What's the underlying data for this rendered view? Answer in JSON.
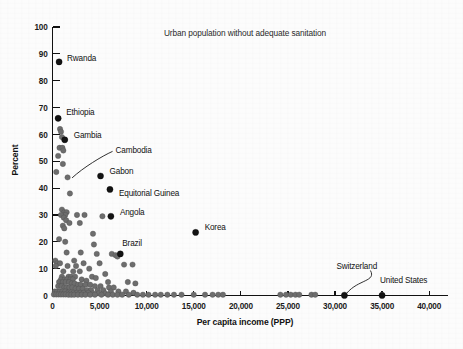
{
  "chart_data": {
    "type": "scatter",
    "title": "Urban population without adequate sanitation",
    "xlabel": "Per capita income (PPP)",
    "ylabel": "Percent",
    "xlim": [
      0,
      42000
    ],
    "ylim": [
      0,
      100
    ],
    "grid": false,
    "legend": "none",
    "xticks": [
      0,
      5000,
      10000,
      15000,
      20000,
      25000,
      30000,
      35000,
      40000
    ],
    "xtick_labels": [
      "0",
      "5,000",
      "10,000",
      "15,000",
      "20,000",
      "25,000",
      "30,000",
      "35,000",
      "40,000"
    ],
    "yticks": [
      0,
      10,
      20,
      30,
      40,
      50,
      60,
      70,
      80,
      90,
      100
    ],
    "ytick_labels": [
      "0",
      "10",
      "20",
      "30",
      "40",
      "50",
      "60",
      "70",
      "80",
      "90",
      "100"
    ],
    "point_color": "#6d6d6d",
    "highlight_color": "#131313",
    "annotations": [
      {
        "label": "Rwanda",
        "x": 700,
        "y": 87,
        "dx": 8,
        "dy": -4,
        "leader": false
      },
      {
        "label": "Ethiopia",
        "x": 600,
        "y": 66,
        "dx": 8,
        "dy": -6,
        "leader": false
      },
      {
        "label": "Gambia",
        "x": 1300,
        "y": 58,
        "dx": 9,
        "dy": -5,
        "leader": false
      },
      {
        "label": "Cambodia",
        "x": 1600,
        "y": 44,
        "dx": 48,
        "dy": -27,
        "leader": true
      },
      {
        "label": "Gabon",
        "x": 5100,
        "y": 44.5,
        "dx": 9,
        "dy": -5,
        "leader": false
      },
      {
        "label": "Equitorial Guinea",
        "x": 6100,
        "y": 39.5,
        "dx": 9,
        "dy": 4,
        "leader": false
      },
      {
        "label": "Angola",
        "x": 6200,
        "y": 29.5,
        "dx": 9,
        "dy": -4,
        "leader": false
      },
      {
        "label": "Brazil",
        "x": 7200,
        "y": 15.5,
        "dx": 2,
        "dy": -11,
        "leader": false
      },
      {
        "label": "Korea",
        "x": 15200,
        "y": 23.5,
        "dx": 9,
        "dy": -5,
        "leader": false
      },
      {
        "label": "Switzerland",
        "x": 31000,
        "y": 0,
        "dx": -8,
        "dy": -30,
        "leader": true
      },
      {
        "label": "United States",
        "x": 35000,
        "y": 0,
        "dx": -2,
        "dy": -16,
        "leader": false
      }
    ],
    "highlight_points": [
      {
        "name": "Rwanda",
        "x": 700,
        "y": 87
      },
      {
        "name": "Ethiopia",
        "x": 600,
        "y": 66
      },
      {
        "name": "Gambia",
        "x": 1300,
        "y": 58
      },
      {
        "name": "Gabon",
        "x": 5100,
        "y": 44.5
      },
      {
        "name": "Equitorial Guinea",
        "x": 6100,
        "y": 39.5
      },
      {
        "name": "Angola",
        "x": 6200,
        "y": 29.5
      },
      {
        "name": "Brazil",
        "x": 7200,
        "y": 15.5
      },
      {
        "name": "Korea",
        "x": 15200,
        "y": 23.5
      },
      {
        "name": "Switzerland",
        "x": 31000,
        "y": 0
      },
      {
        "name": "United States",
        "x": 35000,
        "y": 0
      }
    ],
    "points": [
      [
        600,
        66
      ],
      [
        800,
        62
      ],
      [
        900,
        61
      ],
      [
        1000,
        59
      ],
      [
        1300,
        58
      ],
      [
        750,
        55
      ],
      [
        1050,
        55
      ],
      [
        1150,
        54
      ],
      [
        600,
        52
      ],
      [
        1100,
        49
      ],
      [
        400,
        46
      ],
      [
        1600,
        44
      ],
      [
        1850,
        38
      ],
      [
        1000,
        32
      ],
      [
        1250,
        31
      ],
      [
        1500,
        31
      ],
      [
        1350,
        30
      ],
      [
        900,
        30
      ],
      [
        1200,
        29
      ],
      [
        2600,
        30
      ],
      [
        3400,
        30
      ],
      [
        5300,
        29.5
      ],
      [
        1450,
        28
      ],
      [
        1800,
        27
      ],
      [
        2900,
        27
      ],
      [
        1100,
        26
      ],
      [
        1250,
        25
      ],
      [
        700,
        21
      ],
      [
        1350,
        20
      ],
      [
        4300,
        23
      ],
      [
        4400,
        19
      ],
      [
        1500,
        16
      ],
      [
        3000,
        16
      ],
      [
        4700,
        15.5
      ],
      [
        6300,
        15.5
      ],
      [
        6700,
        15
      ],
      [
        6900,
        14.5
      ],
      [
        300,
        13
      ],
      [
        500,
        12
      ],
      [
        800,
        12
      ],
      [
        2300,
        13
      ],
      [
        3300,
        12
      ],
      [
        5000,
        12
      ],
      [
        7600,
        11.5
      ],
      [
        8500,
        11.5
      ],
      [
        350,
        11
      ],
      [
        1600,
        11
      ],
      [
        2500,
        11
      ],
      [
        3900,
        10
      ],
      [
        1150,
        9
      ],
      [
        2200,
        9
      ],
      [
        2900,
        9
      ],
      [
        5600,
        8
      ],
      [
        1000,
        7
      ],
      [
        1700,
        7
      ],
      [
        2000,
        7
      ],
      [
        2400,
        7
      ],
      [
        4200,
        7
      ],
      [
        4600,
        6.5
      ],
      [
        900,
        6
      ],
      [
        1300,
        6
      ],
      [
        1550,
        6
      ],
      [
        1900,
        6
      ],
      [
        2150,
        6
      ],
      [
        3100,
        6
      ],
      [
        3600,
        5.5
      ],
      [
        5900,
        5
      ],
      [
        8000,
        5
      ],
      [
        8800,
        4.5
      ],
      [
        700,
        5
      ],
      [
        1100,
        5
      ],
      [
        1400,
        5
      ],
      [
        1750,
        5
      ],
      [
        2050,
        4.5
      ],
      [
        2350,
        4.5
      ],
      [
        2700,
        4
      ],
      [
        3000,
        4
      ],
      [
        3500,
        4
      ],
      [
        4000,
        4
      ],
      [
        4500,
        3.5
      ],
      [
        5100,
        3.5
      ],
      [
        6000,
        3
      ],
      [
        6500,
        3
      ],
      [
        600,
        3.5
      ],
      [
        950,
        3.5
      ],
      [
        1250,
        3
      ],
      [
        1500,
        3
      ],
      [
        1800,
        3
      ],
      [
        2100,
        3
      ],
      [
        2450,
        2.5
      ],
      [
        2800,
        2.5
      ],
      [
        3200,
        2.5
      ],
      [
        3700,
        2
      ],
      [
        4100,
        2
      ],
      [
        4800,
        2
      ],
      [
        5400,
        2
      ],
      [
        6200,
        1.5
      ],
      [
        7000,
        1.5
      ],
      [
        7800,
        1.5
      ],
      [
        8600,
        1
      ],
      [
        250,
        1.5
      ],
      [
        500,
        1.5
      ],
      [
        780,
        1.5
      ],
      [
        1050,
        1.5
      ],
      [
        1350,
        1.5
      ],
      [
        1650,
        1
      ],
      [
        1950,
        1
      ],
      [
        2250,
        1
      ],
      [
        2600,
        1
      ],
      [
        2950,
        1
      ],
      [
        3300,
        1
      ],
      [
        3800,
        1
      ],
      [
        4300,
        0.8
      ],
      [
        4900,
        0.8
      ],
      [
        5600,
        0.8
      ],
      [
        150,
        0.4
      ],
      [
        400,
        0.4
      ],
      [
        650,
        0.4
      ],
      [
        900,
        0.4
      ],
      [
        1150,
        0.4
      ],
      [
        1400,
        0.4
      ],
      [
        1700,
        0.3
      ],
      [
        2000,
        0.3
      ],
      [
        2300,
        0.3
      ],
      [
        2700,
        0.3
      ],
      [
        3100,
        0.3
      ],
      [
        3500,
        0.3
      ],
      [
        4000,
        0.3
      ],
      [
        4500,
        0.3
      ],
      [
        5200,
        0.3
      ],
      [
        5900,
        0.3
      ],
      [
        6400,
        0.3
      ],
      [
        6900,
        0.3
      ],
      [
        7400,
        0.3
      ],
      [
        8100,
        0.3
      ],
      [
        9000,
        0.3
      ],
      [
        9600,
        0.3
      ],
      [
        10200,
        0.3
      ],
      [
        10900,
        0.3
      ],
      [
        11500,
        0.3
      ],
      [
        12200,
        0.3
      ],
      [
        12900,
        0.3
      ],
      [
        13700,
        0.3
      ],
      [
        15000,
        0.3
      ],
      [
        16200,
        0.3
      ],
      [
        17000,
        0.3
      ],
      [
        17600,
        0.3
      ],
      [
        18100,
        0.3
      ],
      [
        24200,
        0.3
      ],
      [
        24800,
        0.3
      ],
      [
        25300,
        0.3
      ],
      [
        25800,
        0.3
      ],
      [
        26200,
        0.3
      ],
      [
        27500,
        0.3
      ],
      [
        27900,
        0.3
      ],
      [
        31000,
        0.3
      ],
      [
        35000,
        0.3
      ]
    ]
  }
}
